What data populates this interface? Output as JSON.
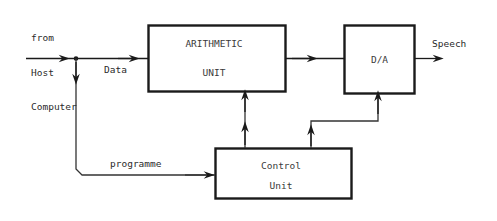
{
  "diagram": {
    "stroke_color": "#1a1a1a",
    "thin_stroke_color": "#444444",
    "text_color": "#2f2f2f",
    "background": "#ffffff",
    "blocks": [
      {
        "id": "arithmetic-unit",
        "line1": "ARITHMETIC",
        "line2": "UNIT",
        "x": 148,
        "y": 25,
        "w": 138,
        "h": 67
      },
      {
        "id": "da-converter",
        "line1": "D/A",
        "line2": "",
        "x": 344,
        "y": 25,
        "w": 71,
        "h": 69
      },
      {
        "id": "control-unit",
        "line1": "Control",
        "line2": "Unit",
        "x": 215,
        "y": 148,
        "w": 137,
        "h": 51
      }
    ],
    "labels": {
      "source": "from\nHost\nComputer",
      "source_line1": "from",
      "source_line2": "Host",
      "source_line3": "Computer",
      "data": "Data",
      "programme": "programme",
      "speech": "Speech"
    }
  }
}
